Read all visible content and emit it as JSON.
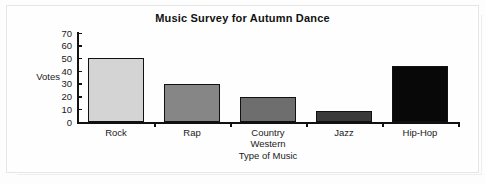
{
  "chart_data": {
    "type": "bar",
    "title": "Music Survey for Autumn Dance",
    "xlabel": "Type of Music",
    "ylabel": "Votes",
    "categories": [
      "Rock",
      "Rap",
      "Country Western",
      "Jazz",
      "Hip-Hop"
    ],
    "category_lines": [
      [
        "Rock"
      ],
      [
        "Rap"
      ],
      [
        "Country",
        "Western"
      ],
      [
        "Jazz"
      ],
      [
        "Hip-Hop"
      ]
    ],
    "values": [
      50,
      30,
      20,
      9,
      44
    ],
    "ylim": [
      0,
      70
    ],
    "ytick_labels": [
      "70",
      "60",
      "50",
      "40",
      "30",
      "20",
      "10",
      "0"
    ],
    "ytick_values": [
      70,
      60,
      50,
      40,
      30,
      20,
      10,
      0
    ],
    "ytick_step": 10,
    "grid": false,
    "legend": false,
    "bar_colors": [
      "#d4d4d4",
      "#868686",
      "#6e6e6e",
      "#3a3a3a",
      "#080808"
    ],
    "bar_edge_color": "#111111",
    "axis_color": "#111111",
    "background": "#fdfdfd"
  }
}
